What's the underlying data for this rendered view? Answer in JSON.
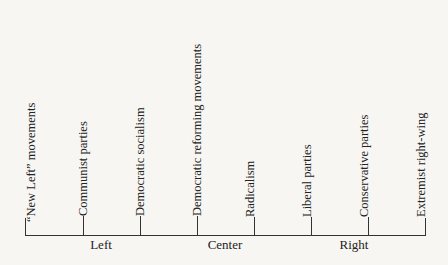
{
  "diagram": {
    "type": "political-spectrum",
    "positions": [
      {
        "label": "“New Left” movements",
        "x": 25
      },
      {
        "label": "Communist parties",
        "x": 83
      },
      {
        "label": "Democratic socialism",
        "x": 140
      },
      {
        "label": "Democratic reforming movements",
        "x": 197
      },
      {
        "label": "Radicalism",
        "x": 254
      },
      {
        "label": "Liberal parties",
        "x": 311
      },
      {
        "label": "Conservative parties",
        "x": 368
      },
      {
        "label": "Extremist right-wing",
        "x": 425
      }
    ],
    "regions": [
      {
        "label": "Left",
        "x": 101
      },
      {
        "label": "Center",
        "x": 225
      },
      {
        "label": "Right",
        "x": 354
      }
    ],
    "colors": {
      "background": "#f7f6f3",
      "ink": "#222222"
    }
  }
}
